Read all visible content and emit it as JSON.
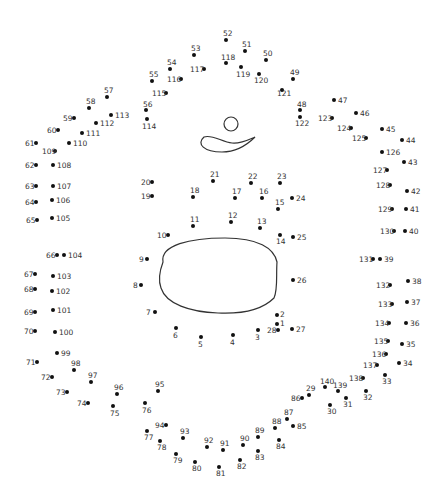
{
  "colors": {
    "dot": "#111111",
    "label": "#333333",
    "line": "#333333",
    "background": "#ffffff"
  },
  "shapes": [
    {
      "name": "head-circle",
      "type": "circle",
      "cx": 231,
      "cy": 124,
      "r": 7
    },
    {
      "name": "swoosh",
      "type": "path",
      "d": "M204 137 C196 144 204 152 222 152 C238 152 250 142 255 137 C248 140 240 144 232 143 C222 142 212 134 204 137 Z"
    },
    {
      "name": "face-oval",
      "type": "path",
      "d": "M163 262 C160 245 190 238 225 238 C258 238 274 248 277 262 C276 275 278 290 274 298 C262 310 240 314 218 313 C190 312 166 304 161 288 C158 280 160 270 163 262 Z"
    }
  ],
  "dots": [
    {
      "n": "1",
      "x": 277,
      "y": 324,
      "lx": 280,
      "ly": 320
    },
    {
      "n": "2",
      "x": 277,
      "y": 315,
      "lx": 280,
      "ly": 311
    },
    {
      "n": "3",
      "x": 258,
      "y": 330,
      "lx": 255,
      "ly": 334
    },
    {
      "n": "4",
      "x": 233,
      "y": 335,
      "lx": 230,
      "ly": 339
    },
    {
      "n": "5",
      "x": 201,
      "y": 337,
      "lx": 198,
      "ly": 341
    },
    {
      "n": "6",
      "x": 176,
      "y": 328,
      "lx": 173,
      "ly": 332
    },
    {
      "n": "7",
      "x": 155,
      "y": 312,
      "lx": 146,
      "ly": 309
    },
    {
      "n": "8",
      "x": 141,
      "y": 285,
      "lx": 133,
      "ly": 282
    },
    {
      "n": "9",
      "x": 147,
      "y": 259,
      "lx": 139,
      "ly": 256
    },
    {
      "n": "10",
      "x": 168,
      "y": 235,
      "lx": 157,
      "ly": 232
    },
    {
      "n": "11",
      "x": 193,
      "y": 226,
      "lx": 190,
      "ly": 216
    },
    {
      "n": "12",
      "x": 231,
      "y": 222,
      "lx": 228,
      "ly": 212
    },
    {
      "n": "13",
      "x": 260,
      "y": 228,
      "lx": 257,
      "ly": 218
    },
    {
      "n": "14",
      "x": 280,
      "y": 235,
      "lx": 276,
      "ly": 238
    },
    {
      "n": "15",
      "x": 278,
      "y": 209,
      "lx": 275,
      "ly": 199
    },
    {
      "n": "16",
      "x": 262,
      "y": 198,
      "lx": 259,
      "ly": 188
    },
    {
      "n": "17",
      "x": 235,
      "y": 198,
      "lx": 232,
      "ly": 188
    },
    {
      "n": "18",
      "x": 193,
      "y": 197,
      "lx": 190,
      "ly": 187
    },
    {
      "n": "19",
      "x": 152,
      "y": 196,
      "lx": 141,
      "ly": 193
    },
    {
      "n": "20",
      "x": 152,
      "y": 182,
      "lx": 141,
      "ly": 179
    },
    {
      "n": "21",
      "x": 213,
      "y": 181,
      "lx": 210,
      "ly": 171
    },
    {
      "n": "22",
      "x": 251,
      "y": 183,
      "lx": 248,
      "ly": 173
    },
    {
      "n": "23",
      "x": 280,
      "y": 183,
      "lx": 277,
      "ly": 173
    },
    {
      "n": "24",
      "x": 292,
      "y": 198,
      "lx": 296,
      "ly": 195
    },
    {
      "n": "25",
      "x": 293,
      "y": 237,
      "lx": 297,
      "ly": 234
    },
    {
      "n": "26",
      "x": 293,
      "y": 280,
      "lx": 297,
      "ly": 277
    },
    {
      "n": "27",
      "x": 292,
      "y": 329,
      "lx": 296,
      "ly": 326
    },
    {
      "n": "28",
      "x": 278,
      "y": 330,
      "lx": 267,
      "ly": 327
    },
    {
      "n": "29",
      "x": 309,
      "y": 395,
      "lx": 306,
      "ly": 385
    },
    {
      "n": "30",
      "x": 330,
      "y": 405,
      "lx": 327,
      "ly": 408
    },
    {
      "n": "31",
      "x": 346,
      "y": 398,
      "lx": 343,
      "ly": 401
    },
    {
      "n": "32",
      "x": 366,
      "y": 391,
      "lx": 363,
      "ly": 394
    },
    {
      "n": "33",
      "x": 385,
      "y": 375,
      "lx": 382,
      "ly": 378
    },
    {
      "n": "34",
      "x": 399,
      "y": 363,
      "lx": 403,
      "ly": 360
    },
    {
      "n": "35",
      "x": 402,
      "y": 344,
      "lx": 406,
      "ly": 341
    },
    {
      "n": "36",
      "x": 406,
      "y": 323,
      "lx": 410,
      "ly": 320
    },
    {
      "n": "37",
      "x": 407,
      "y": 302,
      "lx": 411,
      "ly": 299
    },
    {
      "n": "38",
      "x": 408,
      "y": 281,
      "lx": 412,
      "ly": 278
    },
    {
      "n": "39",
      "x": 380,
      "y": 259,
      "lx": 384,
      "ly": 256
    },
    {
      "n": "40",
      "x": 405,
      "y": 231,
      "lx": 409,
      "ly": 228
    },
    {
      "n": "41",
      "x": 406,
      "y": 209,
      "lx": 410,
      "ly": 206
    },
    {
      "n": "42",
      "x": 407,
      "y": 191,
      "lx": 411,
      "ly": 188
    },
    {
      "n": "43",
      "x": 404,
      "y": 162,
      "lx": 408,
      "ly": 159
    },
    {
      "n": "44",
      "x": 402,
      "y": 140,
      "lx": 406,
      "ly": 137
    },
    {
      "n": "45",
      "x": 382,
      "y": 129,
      "lx": 386,
      "ly": 126
    },
    {
      "n": "46",
      "x": 356,
      "y": 113,
      "lx": 360,
      "ly": 110
    },
    {
      "n": "47",
      "x": 334,
      "y": 100,
      "lx": 338,
      "ly": 97
    },
    {
      "n": "48",
      "x": 300,
      "y": 110,
      "lx": 297,
      "ly": 101
    },
    {
      "n": "49",
      "x": 293,
      "y": 79,
      "lx": 290,
      "ly": 69
    },
    {
      "n": "50",
      "x": 266,
      "y": 60,
      "lx": 263,
      "ly": 50
    },
    {
      "n": "51",
      "x": 245,
      "y": 51,
      "lx": 242,
      "ly": 41
    },
    {
      "n": "52",
      "x": 226,
      "y": 40,
      "lx": 223,
      "ly": 30
    },
    {
      "n": "53",
      "x": 194,
      "y": 55,
      "lx": 191,
      "ly": 45
    },
    {
      "n": "54",
      "x": 170,
      "y": 69,
      "lx": 167,
      "ly": 59
    },
    {
      "n": "55",
      "x": 152,
      "y": 81,
      "lx": 149,
      "ly": 71
    },
    {
      "n": "56",
      "x": 146,
      "y": 110,
      "lx": 143,
      "ly": 101
    },
    {
      "n": "57",
      "x": 107,
      "y": 97,
      "lx": 104,
      "ly": 87
    },
    {
      "n": "58",
      "x": 89,
      "y": 108,
      "lx": 86,
      "ly": 98
    },
    {
      "n": "59",
      "x": 74,
      "y": 118,
      "lx": 63,
      "ly": 115
    },
    {
      "n": "60",
      "x": 58,
      "y": 130,
      "lx": 47,
      "ly": 127
    },
    {
      "n": "61",
      "x": 36,
      "y": 143,
      "lx": 25,
      "ly": 140
    },
    {
      "n": "62",
      "x": 36,
      "y": 165,
      "lx": 25,
      "ly": 162
    },
    {
      "n": "63",
      "x": 36,
      "y": 186,
      "lx": 25,
      "ly": 183
    },
    {
      "n": "64",
      "x": 36,
      "y": 202,
      "lx": 25,
      "ly": 199
    },
    {
      "n": "65",
      "x": 37,
      "y": 220,
      "lx": 26,
      "ly": 217
    },
    {
      "n": "66",
      "x": 57,
      "y": 255,
      "lx": 46,
      "ly": 252
    },
    {
      "n": "67",
      "x": 35,
      "y": 274,
      "lx": 24,
      "ly": 271
    },
    {
      "n": "68",
      "x": 35,
      "y": 289,
      "lx": 24,
      "ly": 286
    },
    {
      "n": "69",
      "x": 35,
      "y": 312,
      "lx": 24,
      "ly": 309
    },
    {
      "n": "70",
      "x": 35,
      "y": 331,
      "lx": 24,
      "ly": 328
    },
    {
      "n": "71",
      "x": 37,
      "y": 362,
      "lx": 26,
      "ly": 359
    },
    {
      "n": "72",
      "x": 52,
      "y": 377,
      "lx": 41,
      "ly": 374
    },
    {
      "n": "73",
      "x": 67,
      "y": 392,
      "lx": 56,
      "ly": 389
    },
    {
      "n": "74",
      "x": 88,
      "y": 403,
      "lx": 77,
      "ly": 400
    },
    {
      "n": "75",
      "x": 113,
      "y": 406,
      "lx": 110,
      "ly": 410
    },
    {
      "n": "76",
      "x": 145,
      "y": 403,
      "lx": 142,
      "ly": 407
    },
    {
      "n": "77",
      "x": 147,
      "y": 431,
      "lx": 144,
      "ly": 434
    },
    {
      "n": "78",
      "x": 160,
      "y": 441,
      "lx": 157,
      "ly": 444
    },
    {
      "n": "79",
      "x": 176,
      "y": 454,
      "lx": 173,
      "ly": 457
    },
    {
      "n": "80",
      "x": 195,
      "y": 462,
      "lx": 192,
      "ly": 465
    },
    {
      "n": "81",
      "x": 219,
      "y": 467,
      "lx": 216,
      "ly": 470
    },
    {
      "n": "82",
      "x": 240,
      "y": 460,
      "lx": 237,
      "ly": 463
    },
    {
      "n": "83",
      "x": 258,
      "y": 451,
      "lx": 255,
      "ly": 454
    },
    {
      "n": "84",
      "x": 279,
      "y": 440,
      "lx": 276,
      "ly": 443
    },
    {
      "n": "85",
      "x": 293,
      "y": 426,
      "lx": 297,
      "ly": 423
    },
    {
      "n": "86",
      "x": 302,
      "y": 398,
      "lx": 291,
      "ly": 395
    },
    {
      "n": "87",
      "x": 287,
      "y": 419,
      "lx": 284,
      "ly": 409
    },
    {
      "n": "88",
      "x": 275,
      "y": 428,
      "lx": 272,
      "ly": 418
    },
    {
      "n": "89",
      "x": 258,
      "y": 437,
      "lx": 255,
      "ly": 427
    },
    {
      "n": "90",
      "x": 243,
      "y": 445,
      "lx": 240,
      "ly": 435
    },
    {
      "n": "91",
      "x": 223,
      "y": 450,
      "lx": 220,
      "ly": 440
    },
    {
      "n": "92",
      "x": 207,
      "y": 447,
      "lx": 204,
      "ly": 437
    },
    {
      "n": "93",
      "x": 183,
      "y": 438,
      "lx": 180,
      "ly": 428
    },
    {
      "n": "94",
      "x": 166,
      "y": 425,
      "lx": 155,
      "ly": 422
    },
    {
      "n": "95",
      "x": 158,
      "y": 391,
      "lx": 155,
      "ly": 381
    },
    {
      "n": "96",
      "x": 117,
      "y": 394,
      "lx": 114,
      "ly": 384
    },
    {
      "n": "97",
      "x": 91,
      "y": 382,
      "lx": 88,
      "ly": 372
    },
    {
      "n": "98",
      "x": 74,
      "y": 370,
      "lx": 71,
      "ly": 360
    },
    {
      "n": "99",
      "x": 57,
      "y": 353,
      "lx": 61,
      "ly": 350
    },
    {
      "n": "100",
      "x": 55,
      "y": 332,
      "lx": 59,
      "ly": 329
    },
    {
      "n": "101",
      "x": 53,
      "y": 310,
      "lx": 57,
      "ly": 307
    },
    {
      "n": "102",
      "x": 52,
      "y": 291,
      "lx": 56,
      "ly": 288
    },
    {
      "n": "103",
      "x": 53,
      "y": 276,
      "lx": 57,
      "ly": 273
    },
    {
      "n": "104",
      "x": 64,
      "y": 255,
      "lx": 68,
      "ly": 252
    },
    {
      "n": "105",
      "x": 52,
      "y": 218,
      "lx": 56,
      "ly": 215
    },
    {
      "n": "106",
      "x": 52,
      "y": 200,
      "lx": 56,
      "ly": 197
    },
    {
      "n": "107",
      "x": 53,
      "y": 186,
      "lx": 57,
      "ly": 183
    },
    {
      "n": "108",
      "x": 53,
      "y": 165,
      "lx": 57,
      "ly": 162
    },
    {
      "n": "109",
      "x": 55,
      "y": 151,
      "lx": 42,
      "ly": 148
    },
    {
      "n": "110",
      "x": 69,
      "y": 143,
      "lx": 73,
      "ly": 140
    },
    {
      "n": "111",
      "x": 82,
      "y": 133,
      "lx": 86,
      "ly": 130
    },
    {
      "n": "112",
      "x": 96,
      "y": 123,
      "lx": 100,
      "ly": 120
    },
    {
      "n": "113",
      "x": 111,
      "y": 115,
      "lx": 115,
      "ly": 112
    },
    {
      "n": "114",
      "x": 147,
      "y": 119,
      "lx": 142,
      "ly": 123
    },
    {
      "n": "115",
      "x": 166,
      "y": 93,
      "lx": 152,
      "ly": 90
    },
    {
      "n": "116",
      "x": 181,
      "y": 79,
      "lx": 167,
      "ly": 76
    },
    {
      "n": "117",
      "x": 204,
      "y": 69,
      "lx": 190,
      "ly": 66
    },
    {
      "n": "118",
      "x": 226,
      "y": 63,
      "lx": 221,
      "ly": 54
    },
    {
      "n": "119",
      "x": 241,
      "y": 67,
      "lx": 236,
      "ly": 71
    },
    {
      "n": "120",
      "x": 259,
      "y": 74,
      "lx": 254,
      "ly": 77
    },
    {
      "n": "121",
      "x": 282,
      "y": 90,
      "lx": 277,
      "ly": 90
    },
    {
      "n": "122",
      "x": 300,
      "y": 117,
      "lx": 295,
      "ly": 120
    },
    {
      "n": "123",
      "x": 332,
      "y": 118,
      "lx": 318,
      "ly": 115
    },
    {
      "n": "124",
      "x": 351,
      "y": 128,
      "lx": 337,
      "ly": 125
    },
    {
      "n": "125",
      "x": 366,
      "y": 138,
      "lx": 352,
      "ly": 135
    },
    {
      "n": "126",
      "x": 382,
      "y": 152,
      "lx": 386,
      "ly": 149
    },
    {
      "n": "127",
      "x": 387,
      "y": 170,
      "lx": 373,
      "ly": 167
    },
    {
      "n": "128",
      "x": 390,
      "y": 185,
      "lx": 376,
      "ly": 182
    },
    {
      "n": "129",
      "x": 392,
      "y": 209,
      "lx": 378,
      "ly": 206
    },
    {
      "n": "130",
      "x": 394,
      "y": 231,
      "lx": 380,
      "ly": 228
    },
    {
      "n": "131",
      "x": 373,
      "y": 259,
      "lx": 359,
      "ly": 256
    },
    {
      "n": "132",
      "x": 390,
      "y": 285,
      "lx": 376,
      "ly": 282
    },
    {
      "n": "133",
      "x": 392,
      "y": 304,
      "lx": 378,
      "ly": 301
    },
    {
      "n": "134",
      "x": 389,
      "y": 323,
      "lx": 375,
      "ly": 320
    },
    {
      "n": "135",
      "x": 388,
      "y": 341,
      "lx": 374,
      "ly": 338
    },
    {
      "n": "136",
      "x": 386,
      "y": 354,
      "lx": 372,
      "ly": 351
    },
    {
      "n": "137",
      "x": 377,
      "y": 365,
      "lx": 363,
      "ly": 362
    },
    {
      "n": "138",
      "x": 363,
      "y": 378,
      "lx": 349,
      "ly": 375
    },
    {
      "n": "139",
      "x": 338,
      "y": 391,
      "lx": 333,
      "ly": 382
    },
    {
      "n": "140",
      "x": 325,
      "y": 387,
      "lx": 320,
      "ly": 378
    }
  ]
}
